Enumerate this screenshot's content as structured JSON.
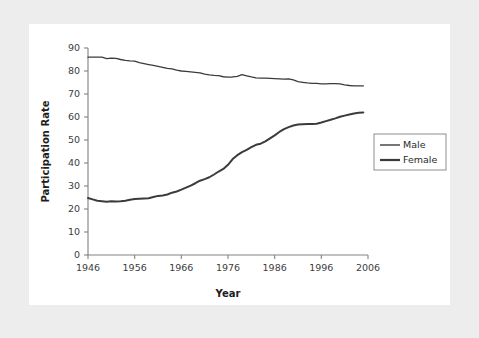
{
  "chart_data": {
    "type": "line",
    "title": "",
    "xlabel": "Year",
    "ylabel": "Participation Rate",
    "xlim": [
      1946,
      2006
    ],
    "ylim": [
      0,
      90
    ],
    "grid": false,
    "legend_position": "right",
    "xticks": [
      "1946",
      "1956",
      "1966",
      "1976",
      "1986",
      "1996",
      "2006"
    ],
    "xtick_values": [
      1946,
      1956,
      1966,
      1976,
      1986,
      1996,
      2006
    ],
    "yticks": [
      "0",
      "10",
      "20",
      "30",
      "40",
      "50",
      "60",
      "70",
      "80",
      "90"
    ],
    "ytick_values": [
      0,
      10,
      20,
      30,
      40,
      50,
      60,
      70,
      80,
      90
    ],
    "x": [
      1946,
      1947,
      1948,
      1949,
      1950,
      1951,
      1952,
      1953,
      1954,
      1955,
      1956,
      1957,
      1958,
      1959,
      1960,
      1961,
      1962,
      1963,
      1964,
      1965,
      1966,
      1967,
      1968,
      1969,
      1970,
      1971,
      1972,
      1973,
      1974,
      1975,
      1976,
      1977,
      1978,
      1979,
      1980,
      1981,
      1982,
      1983,
      1984,
      1985,
      1986,
      1987,
      1988,
      1989,
      1990,
      1991,
      1992,
      1993,
      1994,
      1995,
      1996,
      1997,
      1998,
      1999,
      2000,
      2001,
      2002,
      2003,
      2004,
      2005
    ],
    "series": [
      {
        "name": "Male",
        "line_width": "thin",
        "color": "#3b3b3b",
        "values": [
          86.0,
          86.0,
          86.0,
          86.0,
          85.4,
          85.6,
          85.5,
          85.0,
          84.6,
          84.4,
          84.3,
          83.6,
          83.2,
          82.8,
          82.4,
          82.0,
          81.6,
          81.1,
          80.9,
          80.4,
          80.0,
          79.8,
          79.6,
          79.4,
          79.2,
          78.6,
          78.3,
          78.1,
          78.0,
          77.5,
          77.3,
          77.4,
          77.7,
          78.4,
          77.9,
          77.4,
          77.0,
          76.9,
          76.9,
          76.8,
          76.7,
          76.6,
          76.5,
          76.6,
          76.1,
          75.4,
          75.1,
          74.8,
          74.6,
          74.6,
          74.4,
          74.4,
          74.5,
          74.5,
          74.4,
          74.0,
          73.7,
          73.5,
          73.5,
          73.5
        ]
      },
      {
        "name": "Female",
        "line_width": "thick",
        "color": "#3b3b3b",
        "values": [
          24.8,
          24.2,
          23.6,
          23.4,
          23.2,
          23.4,
          23.3,
          23.4,
          23.6,
          24.0,
          24.3,
          24.5,
          24.6,
          24.7,
          25.2,
          25.7,
          25.9,
          26.3,
          27.1,
          27.6,
          28.4,
          29.3,
          30.2,
          31.2,
          32.3,
          33.0,
          33.8,
          35.0,
          36.3,
          37.4,
          39.2,
          41.7,
          43.4,
          44.7,
          45.7,
          46.9,
          47.9,
          48.4,
          49.4,
          50.7,
          52.0,
          53.5,
          54.7,
          55.6,
          56.3,
          56.7,
          56.9,
          57.0,
          57.0,
          57.1,
          57.6,
          58.2,
          58.8,
          59.4,
          60.1,
          60.6,
          61.1,
          61.5,
          61.8,
          62.0
        ]
      }
    ]
  },
  "legend": {
    "entries": [
      {
        "label": "Male"
      },
      {
        "label": "Female"
      }
    ]
  }
}
